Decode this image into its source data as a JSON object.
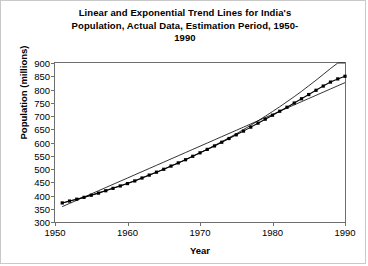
{
  "chart_data": {
    "type": "line",
    "title_lines": [
      "Linear and Exponential Trend Lines for India's",
      "Population, Actual Data, Estimation Period, 1950-",
      "1990"
    ],
    "xlabel": "Year",
    "ylabel": "Population (millions)",
    "xlim": [
      1950,
      1990
    ],
    "ylim": [
      300,
      900
    ],
    "xticks": [
      1950,
      1960,
      1970,
      1980,
      1990
    ],
    "yticks": [
      300,
      350,
      400,
      450,
      500,
      550,
      600,
      650,
      700,
      750,
      800,
      850,
      900
    ],
    "grid": false,
    "legend": "none",
    "colors": {
      "data": "#000000",
      "trend": "#000000",
      "axis": "#6f6f6f",
      "background": "#ffffff"
    },
    "x": [
      1951,
      1952,
      1953,
      1954,
      1955,
      1956,
      1957,
      1958,
      1959,
      1960,
      1961,
      1962,
      1963,
      1964,
      1965,
      1966,
      1967,
      1968,
      1969,
      1970,
      1971,
      1972,
      1973,
      1974,
      1975,
      1976,
      1977,
      1978,
      1979,
      1980,
      1981,
      1982,
      1983,
      1984,
      1985,
      1986,
      1987,
      1988,
      1989,
      1990
    ],
    "series": [
      {
        "name": "Actual Data",
        "marker": "square",
        "values": [
          372,
          379,
          386,
          393,
          401,
          409,
          418,
          427,
          436,
          445,
          455,
          466,
          477,
          488,
          499,
          511,
          523,
          535,
          548,
          561,
          574,
          587,
          601,
          615,
          629,
          643,
          658,
          673,
          688,
          703,
          718,
          733,
          749,
          765,
          781,
          797,
          813,
          828,
          840,
          850
        ]
      },
      {
        "name": "Exponential Trend Line",
        "marker": "none",
        "values": [
          371,
          379,
          386,
          394,
          402,
          410,
          419,
          428,
          437,
          446,
          456,
          466,
          477,
          488,
          499,
          511,
          523,
          535,
          548,
          561,
          575,
          589,
          603,
          618,
          633,
          649,
          665,
          682,
          699,
          717,
          735,
          754,
          773,
          793,
          814,
          835,
          857,
          879,
          903,
          927
        ]
      },
      {
        "name": "Linear Trend Line",
        "marker": "none",
        "values": [
          358,
          370,
          382,
          394,
          406,
          418,
          430,
          442,
          454,
          466,
          478,
          490,
          502,
          514,
          526,
          538,
          550,
          562,
          574,
          586,
          598,
          610,
          622,
          634,
          646,
          658,
          670,
          682,
          694,
          706,
          718,
          730,
          742,
          754,
          766,
          778,
          790,
          802,
          814,
          826
        ]
      }
    ]
  }
}
